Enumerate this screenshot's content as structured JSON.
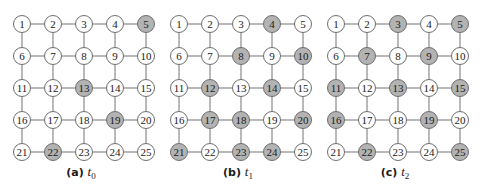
{
  "figure": {
    "grid": {
      "rows": 5,
      "cols": 5,
      "nodes": [
        1,
        2,
        3,
        4,
        5,
        6,
        7,
        8,
        9,
        10,
        11,
        12,
        13,
        14,
        15,
        16,
        17,
        18,
        19,
        20,
        21,
        22,
        23,
        24,
        25
      ]
    },
    "colors": {
      "highlight_fill": "#b3b3b3",
      "normal_fill": "#ffffff",
      "edge": "#8a8a8a",
      "stroke": "#6e6e6e"
    },
    "panels": [
      {
        "label": "(a)",
        "var": "t",
        "sub": "0",
        "highlighted": [
          5,
          13,
          19,
          22
        ]
      },
      {
        "label": "(b)",
        "var": "t",
        "sub": "1",
        "highlighted": [
          4,
          8,
          10,
          12,
          14,
          17,
          18,
          20,
          21,
          23,
          24
        ]
      },
      {
        "label": "(c)",
        "var": "t",
        "sub": "2",
        "highlighted": [
          3,
          5,
          7,
          9,
          11,
          13,
          15,
          16,
          19,
          22,
          25
        ]
      }
    ]
  }
}
